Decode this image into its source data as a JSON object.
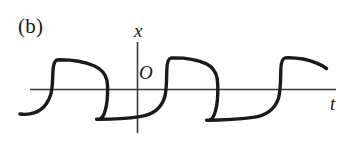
{
  "figure": {
    "panel_label": "(b)",
    "axis_label_vertical": "x",
    "axis_label_horizontal": "t",
    "origin_label": "O",
    "stroke_color": "#1a1a1a",
    "axis_color": "#3a3a3a",
    "background_color": "#ffffff"
  },
  "chart_data": {
    "type": "line",
    "title": "(b)",
    "xlabel": "t",
    "ylabel": "x",
    "annotations": [
      "O"
    ],
    "grid": false,
    "legend": null,
    "axis": {
      "horizontal_line_y": 0,
      "horizontal_x_start": 30,
      "horizontal_x_end": 336,
      "vertical_line_x": 137,
      "vertical_y_top": 42,
      "vertical_y_bottom": 133
    },
    "waveform_levels": {
      "high_plateau_start": 60,
      "high_plateau_end": 74,
      "low_plateau": 119,
      "zero_line": 89
    },
    "transitions": [
      {
        "type": "jump-up",
        "x": 53
      },
      {
        "type": "drop-down",
        "x": 108
      },
      {
        "type": "jump-up",
        "x": 167
      },
      {
        "type": "drop-down",
        "x": 218
      },
      {
        "type": "jump-up",
        "x": 281
      }
    ],
    "path": "M 20,114 C 30,115 40,112 47,103 C 51,97 52,92 53,78 L 53,74 C 53,66 54,61 57,60 L 60,60 C 72,60 84,62 94,66 C 101,69 105,74 107,80 L 108,86 C 108,96 107,104 105,110 C 104,116 102,119 99,119 L 97,119 C 110,119 126,118 140,116 C 152,114 161,108 165,97 C 166,92 167,84 167,74 L 167,70 C 167,62 168,59 171,58 L 174,58 C 186,58 197,60 206,64 C 212,67 216,72 217,79 L 218,86 C 218,97 217,106 215,112 C 214,117 212,120 209,120 L 207,120 C 221,120 238,119 253,117 C 266,115 275,109 279,98 C 280,93 281,85 281,74 L 281,70 C 281,62 282,59 285,58 L 288,58 C 298,58 308,60 316,63 C 322,65 325,67 326,69",
    "series": [
      {
        "name": "x(t)",
        "points": [
          [
            20,
            114
          ],
          [
            30,
            115
          ],
          [
            40,
            112
          ],
          [
            47,
            103
          ],
          [
            52,
            92
          ],
          [
            53,
            78
          ],
          [
            53,
            74
          ],
          [
            57,
            60
          ],
          [
            60,
            60
          ],
          [
            72,
            60
          ],
          [
            84,
            62
          ],
          [
            94,
            66
          ],
          [
            105,
            74
          ],
          [
            108,
            86
          ],
          [
            108,
            96
          ],
          [
            105,
            110
          ],
          [
            99,
            119
          ],
          [
            110,
            119
          ],
          [
            126,
            118
          ],
          [
            140,
            116
          ],
          [
            152,
            114
          ],
          [
            165,
            97
          ],
          [
            167,
            84
          ],
          [
            167,
            70
          ],
          [
            171,
            58
          ],
          [
            174,
            58
          ],
          [
            186,
            58
          ],
          [
            197,
            60
          ],
          [
            206,
            64
          ],
          [
            217,
            79
          ],
          [
            218,
            86
          ],
          [
            218,
            97
          ],
          [
            215,
            112
          ],
          [
            209,
            120
          ],
          [
            221,
            120
          ],
          [
            238,
            119
          ],
          [
            253,
            117
          ],
          [
            266,
            115
          ],
          [
            279,
            98
          ],
          [
            281,
            85
          ],
          [
            281,
            70
          ],
          [
            285,
            58
          ],
          [
            288,
            58
          ],
          [
            298,
            58
          ],
          [
            308,
            60
          ],
          [
            316,
            63
          ],
          [
            326,
            69
          ]
        ]
      }
    ]
  }
}
